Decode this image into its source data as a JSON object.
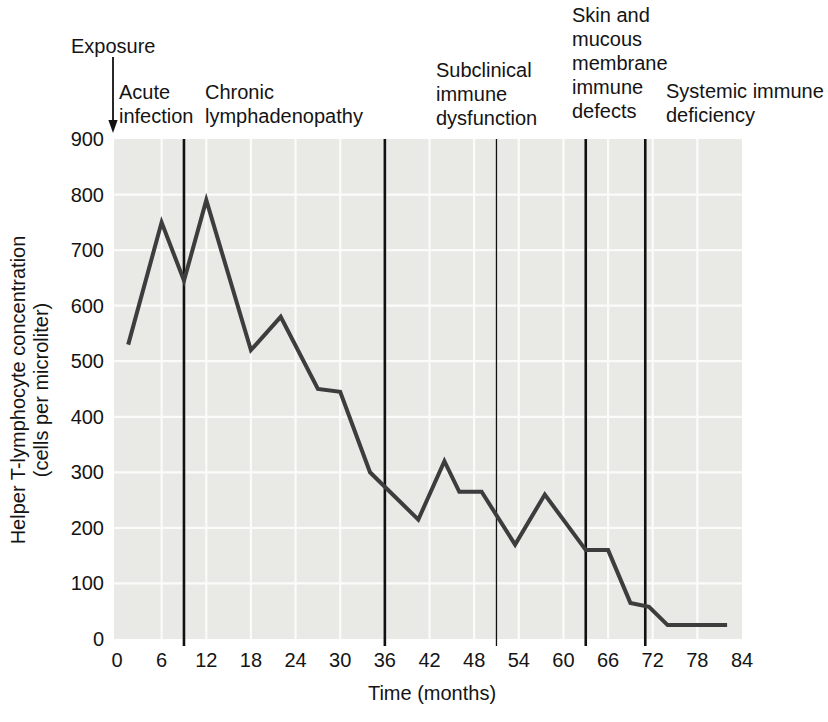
{
  "figure": {
    "description_text": ""
  },
  "colors": {
    "page_bg": "#ffffff",
    "panel_bg": "#e9e9e6",
    "gridline": "#fbfbfa",
    "series_line": "#3d3d3d",
    "boundary_line": "#111111",
    "text": "#141414"
  },
  "annotations": {
    "exposure": {
      "label": "Exposure"
    },
    "phase_labels": [
      {
        "label": "Acute\ninfection",
        "x": 119,
        "top": 80
      },
      {
        "label": "Chronic\nlymphadenopathy",
        "x": 205,
        "top": 80
      },
      {
        "label": "Subclinical\nimmune\ndysfunction",
        "x": 436,
        "top": 58
      },
      {
        "label": "Skin and\nmucous\nmembrane\nimmune\ndefects",
        "x": 572,
        "top": 3
      },
      {
        "label": "Systemic immune\ndeficiency",
        "x": 666,
        "top": 79
      }
    ]
  },
  "chart_data": {
    "type": "line",
    "title": "",
    "xlabel": "Time (months)",
    "ylabel": "Helper T-lymphocyte concentration (cells per microliter)",
    "ylabel_line1": "Helper T-lymphocyte concentration",
    "ylabel_line2": "(cells per microliter)",
    "xlim": [
      0,
      84
    ],
    "ylim": [
      0,
      900
    ],
    "x_ticks": [
      0,
      6,
      12,
      18,
      24,
      30,
      36,
      42,
      48,
      54,
      60,
      66,
      72,
      78,
      84
    ],
    "y_ticks": [
      0,
      100,
      200,
      300,
      400,
      500,
      600,
      700,
      800,
      900
    ],
    "grid": "white gridlines every 6 months and every 100 cells on light gray panel",
    "legend": "none",
    "series": [
      {
        "name": "Helper T-lymphocyte concentration",
        "points": [
          [
            1.5,
            530
          ],
          [
            6,
            750
          ],
          [
            9,
            645
          ],
          [
            12,
            790
          ],
          [
            18,
            520
          ],
          [
            22,
            580
          ],
          [
            27,
            450
          ],
          [
            30,
            445
          ],
          [
            34,
            300
          ],
          [
            40.5,
            215
          ],
          [
            44,
            320
          ],
          [
            46,
            265
          ],
          [
            49,
            265
          ],
          [
            53.5,
            170
          ],
          [
            57.5,
            260
          ],
          [
            63,
            160
          ],
          [
            66,
            160
          ],
          [
            69,
            65
          ],
          [
            71.5,
            58
          ],
          [
            74,
            25
          ],
          [
            82,
            25
          ]
        ]
      }
    ],
    "phase_boundaries": [
      {
        "month": 9,
        "thin": false
      },
      {
        "month": 36,
        "thin": false
      },
      {
        "month": 51,
        "thin": true
      },
      {
        "month": 63,
        "thin": false
      },
      {
        "month": 71,
        "thin": false
      }
    ]
  }
}
